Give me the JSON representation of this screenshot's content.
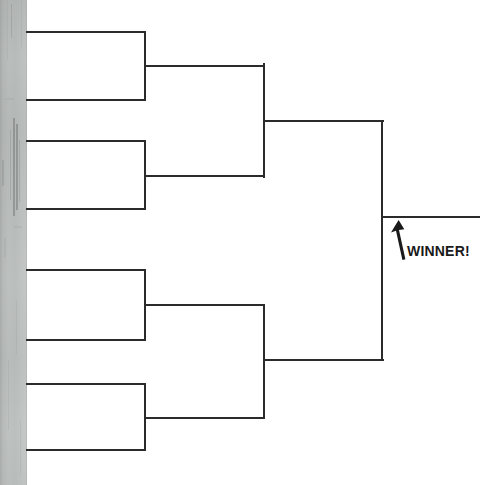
{
  "document": {
    "kind": "tournament-bracket-worksheet",
    "title": "Tournament Bracket",
    "background_color": "#ffffff",
    "line_color": "#2b2b2b",
    "scan_edge_color": "#b8bcbb"
  },
  "annotation": {
    "winner_label": "WINNER!",
    "arrow_icon": "up-arrow-icon",
    "arrow_points_to": "champion-slot-line"
  },
  "bracket": {
    "rounds": 3,
    "entries": 4,
    "round_labels": [
      "Round 1",
      "Round 2",
      "Final"
    ],
    "round_1": {
      "matches": [
        {
          "name": "match-1",
          "slot_top": {
            "name": "seed-1-slot",
            "label": "",
            "line": {
              "x": 26,
              "y": 31,
              "length": 119
            }
          },
          "slot_bottom": {
            "name": "seed-2-slot",
            "label": "",
            "line": {
              "x": 26,
              "y": 99,
              "length": 119
            }
          },
          "connector": {
            "x": 144,
            "y_top": 31,
            "y_bottom": 100
          },
          "advance_line": {
            "x": 144,
            "y": 66,
            "length": 121
          }
        },
        {
          "name": "match-2",
          "slot_top": {
            "name": "seed-3-slot",
            "label": "",
            "line": {
              "x": 26,
              "y": 140,
              "length": 119
            }
          },
          "slot_bottom": {
            "name": "seed-4-slot",
            "label": "",
            "line": {
              "x": 26,
              "y": 208,
              "length": 119
            }
          },
          "connector": {
            "x": 144,
            "y_top": 140,
            "y_bottom": 209
          },
          "advance_line": {
            "x": 144,
            "y": 175,
            "length": 121
          }
        },
        {
          "name": "match-3",
          "slot_top": {
            "name": "seed-5-slot",
            "label": "",
            "line": {
              "x": 26,
              "y": 269,
              "length": 119
            }
          },
          "slot_bottom": {
            "name": "seed-6-slot",
            "label": "",
            "line": {
              "x": 26,
              "y": 339,
              "length": 119
            }
          },
          "connector": {
            "x": 144,
            "y_top": 269,
            "y_bottom": 340
          },
          "advance_line": {
            "x": 144,
            "y": 305,
            "length": 121
          }
        },
        {
          "name": "match-4",
          "slot_top": {
            "name": "seed-7-slot",
            "label": "",
            "line": {
              "x": 26,
              "y": 383,
              "length": 119
            }
          },
          "slot_bottom": {
            "name": "seed-8-slot",
            "label": "",
            "line": {
              "x": 26,
              "y": 449,
              "length": 119
            }
          },
          "connector": {
            "x": 144,
            "y_top": 383,
            "y_bottom": 450
          },
          "advance_line": {
            "x": 144,
            "y": 416,
            "length": 121
          }
        }
      ]
    },
    "round_2": {
      "matches": [
        {
          "name": "semifinal-1",
          "slot_top": {
            "name": "semifinal-1-top-slot",
            "label": ""
          },
          "slot_bottom": {
            "name": "semifinal-1-bottom-slot",
            "label": ""
          },
          "connector": {
            "x": 263,
            "y_top": 63,
            "y_bottom": 177
          },
          "advance_line": {
            "x": 263,
            "y": 120,
            "length": 121
          }
        },
        {
          "name": "semifinal-2",
          "slot_top": {
            "name": "semifinal-2-top-slot",
            "label": ""
          },
          "slot_bottom": {
            "name": "semifinal-2-bottom-slot",
            "label": ""
          },
          "connector": {
            "x": 263,
            "y_top": 304,
            "y_bottom": 418
          },
          "advance_line": {
            "x": 263,
            "y": 360,
            "length": 121
          }
        }
      ]
    },
    "round_3": {
      "matches": [
        {
          "name": "final-match",
          "slot_top": {
            "name": "finalist-top-slot",
            "label": ""
          },
          "slot_bottom": {
            "name": "finalist-bottom-slot",
            "label": ""
          },
          "connector": {
            "x": 381,
            "y_top": 121,
            "y_bottom": 361
          },
          "advance_line": {
            "x": 381,
            "y": 216,
            "length": 99
          }
        }
      ]
    }
  }
}
